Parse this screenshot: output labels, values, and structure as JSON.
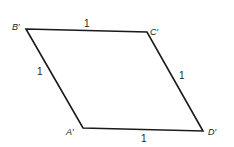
{
  "diagram": {
    "type": "parallelogram",
    "stroke_color": "#1a1a1a",
    "vertices": [
      {
        "id": "B",
        "label": "B′",
        "x": 26,
        "y": 29,
        "label_x": 12,
        "label_y": 30
      },
      {
        "id": "C",
        "label": "C′",
        "x": 147,
        "y": 32,
        "label_x": 150,
        "label_y": 35
      },
      {
        "id": "D",
        "label": "D′",
        "x": 203,
        "y": 131,
        "label_x": 208,
        "label_y": 135
      },
      {
        "id": "A",
        "label": "A′",
        "x": 83,
        "y": 128,
        "label_x": 66,
        "label_y": 135
      }
    ],
    "edges": [
      {
        "from": "B",
        "to": "C",
        "length_label": "1",
        "label_x": 84,
        "label_y": 27
      },
      {
        "from": "C",
        "to": "D",
        "length_label": "1",
        "label_x": 179,
        "label_y": 79
      },
      {
        "from": "D",
        "to": "A",
        "length_label": "1",
        "label_x": 141,
        "label_y": 142
      },
      {
        "from": "A",
        "to": "B",
        "length_label": "1",
        "label_x": 37,
        "label_y": 75
      }
    ]
  }
}
